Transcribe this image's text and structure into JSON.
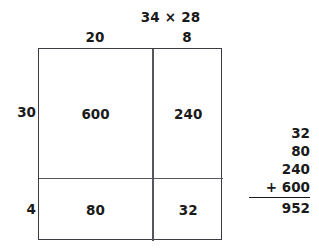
{
  "title": "34 × 28",
  "area_model": {
    "column_headers": [
      "20",
      "8"
    ],
    "row_headers": [
      "30",
      "4"
    ],
    "cells": [
      [
        "600",
        "240"
      ],
      [
        "80",
        "32"
      ]
    ]
  },
  "sum_column": {
    "addends": [
      "32",
      "80",
      "240",
      "+ 600"
    ],
    "total": "952"
  },
  "colors": {
    "text": "#1a1a1a",
    "grid_border": "#3b3b42",
    "grid_divider": "#56565e",
    "background": "#ffffff"
  },
  "chart_data": {
    "type": "table",
    "title": "34 × 28",
    "xlabel": "",
    "ylabel": "",
    "column_categories": [
      "20",
      "8"
    ],
    "row_categories": [
      "30",
      "4"
    ],
    "values": [
      [
        600,
        240
      ],
      [
        80,
        32
      ]
    ],
    "partial_products": [
      32,
      80,
      240,
      600
    ],
    "total": 952,
    "grid": true,
    "legend": "none"
  }
}
